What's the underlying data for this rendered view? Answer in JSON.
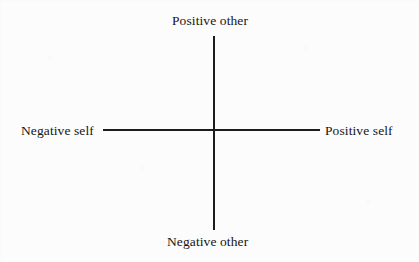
{
  "figure": {
    "type": "two-axis-cross-diagram",
    "background_color": "#fbfbfb",
    "ink_color": "#1c1c1c"
  },
  "chart_data": {
    "type": "scatter",
    "title": "",
    "subtitle": "",
    "xlabel": "",
    "ylabel": "",
    "grid": false,
    "legend": false,
    "series": [],
    "x": [],
    "values": [],
    "axes": {
      "horizontal": {
        "name": "self",
        "negative_pole": "Negative self",
        "positive_pole": "Positive self",
        "origin_px": 214,
        "start_px": 103,
        "end_px": 320
      },
      "vertical": {
        "name": "other",
        "negative_pole": "Negative other",
        "positive_pole": "Positive other",
        "origin_px": 130,
        "start_px": 36,
        "end_px": 230
      }
    },
    "annotations": [
      {
        "text": "Positive other",
        "position": "top"
      },
      {
        "text": "Positive self",
        "position": "right"
      },
      {
        "text": "Negative other",
        "position": "bottom"
      },
      {
        "text": "Negative self",
        "position": "left"
      }
    ]
  },
  "labels": {
    "positive_other": "Positive other",
    "negative_other": "Negative other",
    "negative_self": "Negative self",
    "positive_self": "Positive self"
  }
}
